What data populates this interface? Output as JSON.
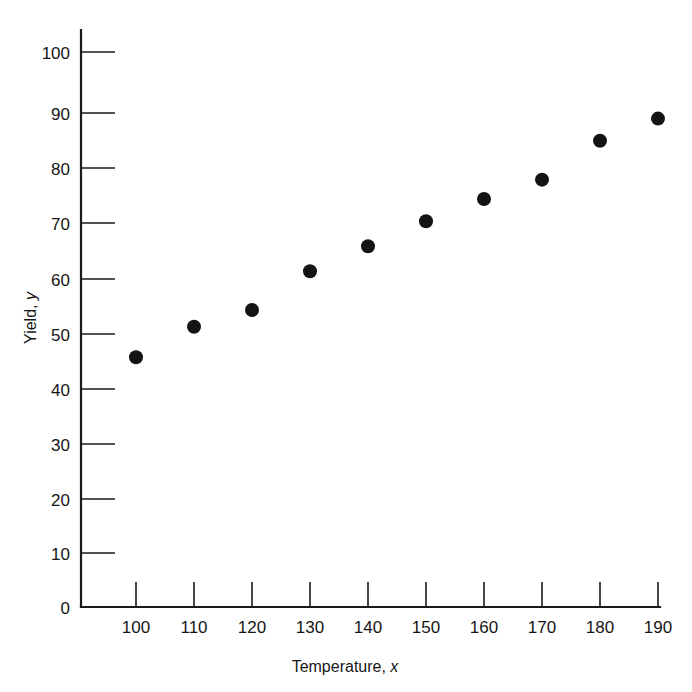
{
  "chart_data": {
    "type": "scatter",
    "title": "",
    "xlabel": "Temperature, x",
    "ylabel": "Yield, y",
    "xlabel_text": "Temperature,",
    "xlabel_var": "x",
    "ylabel_text": "Yield,",
    "ylabel_var": "y",
    "x": [
      100,
      110,
      120,
      130,
      140,
      150,
      160,
      170,
      180,
      190
    ],
    "y": [
      45.0,
      50.5,
      53.5,
      60.5,
      65.0,
      69.5,
      73.5,
      77.0,
      84.0,
      88.0
    ],
    "points": [
      {
        "x": 100,
        "y": 45.0
      },
      {
        "x": 110,
        "y": 50.5
      },
      {
        "x": 120,
        "y": 53.5
      },
      {
        "x": 130,
        "y": 60.5
      },
      {
        "x": 140,
        "y": 65.0
      },
      {
        "x": 150,
        "y": 69.5
      },
      {
        "x": 160,
        "y": 73.5
      },
      {
        "x": 170,
        "y": 77.0
      },
      {
        "x": 180,
        "y": 84.0
      },
      {
        "x": 190,
        "y": 88.0
      }
    ],
    "xlim": [
      95,
      196
    ],
    "ylim": [
      0,
      105
    ],
    "xticks": [
      100,
      110,
      120,
      130,
      140,
      150,
      160,
      170,
      180,
      190
    ],
    "yticks": [
      0,
      10,
      20,
      30,
      40,
      50,
      60,
      70,
      80,
      90,
      100
    ],
    "xtick_labels": [
      "100",
      "110",
      "120",
      "130",
      "140",
      "150",
      "160",
      "170",
      "180",
      "190"
    ],
    "ytick_labels": [
      "0",
      "10",
      "20",
      "30",
      "40",
      "50",
      "60",
      "70",
      "80",
      "90",
      "100"
    ],
    "grid": false,
    "legend": null,
    "marker": "filled-circle",
    "marker_color": "#141414",
    "axis_color": "#1a1a1a",
    "background_color": "#ffffff",
    "tick_direction": "in"
  }
}
